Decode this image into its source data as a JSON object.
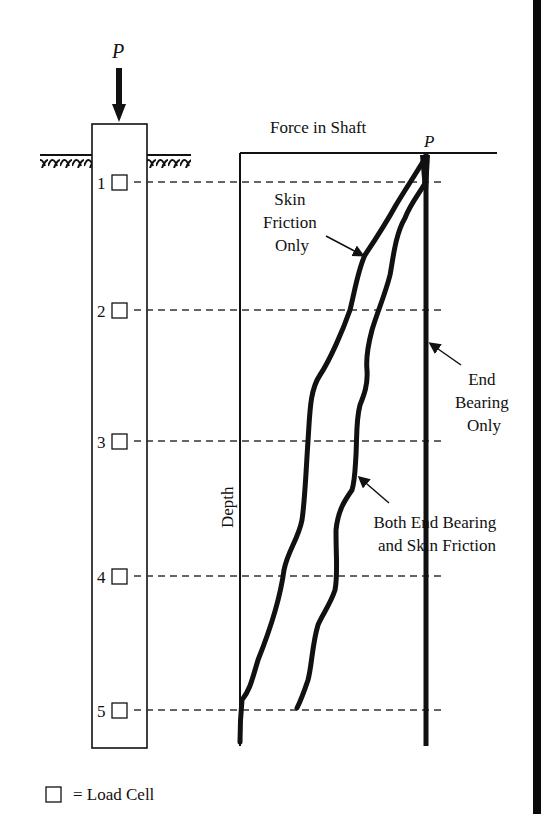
{
  "diagram": {
    "load_label": "P",
    "top_load_label": "P",
    "graph_title": "Force in Shaft",
    "axis_label": "Depth",
    "load_cells": [
      {
        "label": "1",
        "y": 182
      },
      {
        "label": "2",
        "y": 310
      },
      {
        "label": "3",
        "y": 441
      },
      {
        "label": "4",
        "y": 576
      },
      {
        "label": "5",
        "y": 710
      }
    ],
    "annotations": {
      "skin_friction": [
        "Skin",
        "Friction",
        "Only"
      ],
      "end_bearing": [
        "End",
        "Bearing",
        "Only"
      ],
      "both": [
        "Both End Bearing",
        "and Skin Friction"
      ]
    },
    "legend": {
      "symbol": "□",
      "text": "= Load Cell"
    },
    "colors": {
      "ink": "#111111",
      "background": "#ffffff"
    }
  }
}
